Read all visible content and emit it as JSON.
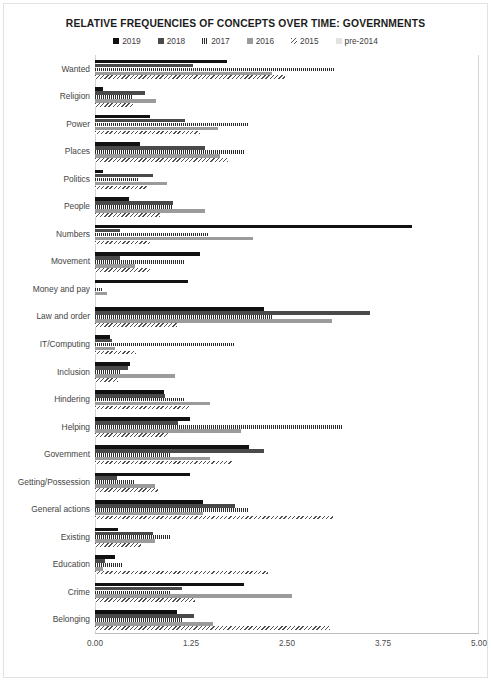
{
  "chart_data": {
    "type": "bar",
    "orientation": "horizontal",
    "title": "RELATIVE FREQUENCIES OF CONCEPTS OVER TIME: GOVERNMENTS",
    "xlabel": "",
    "ylabel": "",
    "xlim": [
      0,
      5
    ],
    "xticks": [
      "0.00",
      "1.25",
      "2.50",
      "3.75",
      "5.00"
    ],
    "xtick_values": [
      0,
      1.25,
      2.5,
      3.75,
      5
    ],
    "grid": false,
    "legend_position": "top-center",
    "categories": [
      "Wanted",
      "Religion",
      "Power",
      "Places",
      "Politics",
      "People",
      "Numbers",
      "Movement",
      "Money and pay",
      "Law and order",
      "IT/Computing",
      "Inclusion",
      "Hindering",
      "Helping",
      "Government",
      "Getting/Possession",
      "General actions",
      "Existing",
      "Education",
      "Crime",
      "Belonging"
    ],
    "series": [
      {
        "name": "2019",
        "color": "#111111",
        "pattern": "solid",
        "values": [
          1.72,
          0.1,
          0.72,
          0.59,
          0.1,
          0.44,
          4.13,
          1.37,
          1.21,
          2.2,
          0.2,
          0.46,
          0.9,
          1.24,
          2.0,
          1.24,
          1.4,
          0.3,
          0.26,
          1.94,
          1.07
        ]
      },
      {
        "name": "2018",
        "color": "#4a4a4a",
        "pattern": "solid",
        "values": [
          1.28,
          0.65,
          1.17,
          1.43,
          0.75,
          1.02,
          0.33,
          0.33,
          0.0,
          3.58,
          0.22,
          0.43,
          0.91,
          1.08,
          2.2,
          0.28,
          1.82,
          0.75,
          0.13,
          1.13,
          1.29
        ]
      },
      {
        "name": "2017",
        "color": "#5a5a5a",
        "pattern": "vertical-stripes",
        "values": [
          3.12,
          0.48,
          2.0,
          1.95,
          0.56,
          1.02,
          1.48,
          1.17,
          0.1,
          2.3,
          1.82,
          0.33,
          1.17,
          3.23,
          0.98,
          0.52,
          2.0,
          0.98,
          0.35,
          0.98,
          1.13
        ]
      },
      {
        "name": "2016",
        "color": "#9b9b9b",
        "pattern": "solid",
        "values": [
          2.3,
          0.8,
          1.6,
          1.63,
          0.94,
          1.43,
          2.06,
          0.52,
          0.16,
          3.09,
          0.26,
          1.04,
          1.5,
          1.9,
          1.5,
          0.78,
          1.4,
          0.78,
          0.1,
          2.57,
          1.54
        ]
      },
      {
        "name": "2015",
        "color": "#bdbdbd",
        "pattern": "diagonal-hatch",
        "values": [
          2.48,
          0.5,
          1.37,
          1.73,
          0.69,
          0.85,
          0.72,
          0.72,
          0.0,
          1.07,
          0.53,
          0.3,
          1.24,
          0.95,
          1.8,
          0.82,
          3.1,
          0.6,
          2.25,
          1.3,
          3.06
        ]
      },
      {
        "name": "pre-2014",
        "color": "#e2e2e2",
        "pattern": "solid",
        "values": [
          0.0,
          0.0,
          0.0,
          0.0,
          0.0,
          0.0,
          0.0,
          0.0,
          0.0,
          0.0,
          0.0,
          0.0,
          0.0,
          0.0,
          0.0,
          0.0,
          0.0,
          0.0,
          0.0,
          0.0,
          0.0
        ]
      }
    ]
  },
  "legend": {
    "items": [
      {
        "label": "2019",
        "key": "s2019"
      },
      {
        "label": "2018",
        "key": "s2018"
      },
      {
        "label": "2017",
        "key": "s2017"
      },
      {
        "label": "2016",
        "key": "s2016"
      },
      {
        "label": "2015",
        "key": "s2015"
      },
      {
        "label": "pre-2014",
        "key": "s2014"
      }
    ]
  }
}
